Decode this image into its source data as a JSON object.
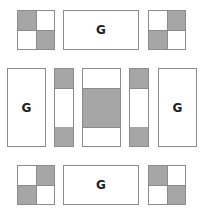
{
  "diagram": {
    "colors": {
      "fill_gray": "#a6a6a6",
      "stroke": "#8c8c8c",
      "background": "#ffffff"
    },
    "top_row": {
      "left_square": {
        "shaded": [
          "top-left",
          "bottom-right"
        ]
      },
      "center_rect": {
        "label": "G"
      },
      "right_square": {
        "shaded": [
          "top-right",
          "bottom-left"
        ]
      }
    },
    "middle_row": {
      "left_tall_rect": {
        "label": "G"
      },
      "left_strip": {
        "shaded": [
          "top",
          "bottom"
        ]
      },
      "center_block": {
        "shaded": [
          "middle"
        ]
      },
      "right_strip": {
        "shaded": [
          "top",
          "bottom"
        ]
      },
      "right_tall_rect": {
        "label": "G"
      }
    },
    "bottom_row": {
      "left_square": {
        "shaded": [
          "top-right",
          "bottom-left"
        ]
      },
      "center_rect": {
        "label": "G"
      },
      "right_square": {
        "shaded": [
          "top-left",
          "bottom-right"
        ]
      }
    }
  }
}
